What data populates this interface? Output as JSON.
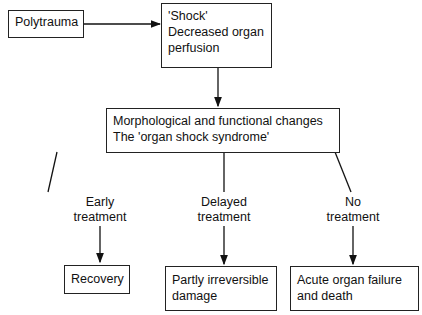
{
  "nodes": {
    "polytrauma": {
      "text": "Polytrauma"
    },
    "shock": {
      "line1": "'Shock'",
      "line2": "Decreased organ",
      "line3": "perfusion"
    },
    "changes": {
      "line1": "Morphological and functional changes",
      "line2": "The 'organ shock syndrome'"
    },
    "recovery": {
      "text": "Recovery"
    },
    "partly": {
      "line1": "Partly irreversible",
      "line2": "damage"
    },
    "acute": {
      "line1": "Acute organ failure",
      "line2": "and death"
    }
  },
  "branches": {
    "early": {
      "line1": "Early",
      "line2": "treatment"
    },
    "delayed": {
      "line1": "Delayed",
      "line2": "treatment"
    },
    "none": {
      "line1": "No",
      "line2": "treatment"
    }
  }
}
